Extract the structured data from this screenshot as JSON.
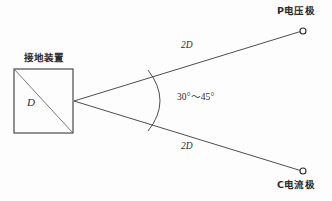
{
  "diagram": {
    "background_color": "#fdfdfd",
    "line_color": "#3a3a3a",
    "text_color": "#2b2b2b",
    "labels": {
      "ground_device": "接地装置",
      "device_diagonal": "D",
      "distance_upper": "2D",
      "distance_lower": "2D",
      "angle_range": "30°～45°",
      "voltage_pole": "P电压极",
      "current_pole": "C电流极"
    },
    "geometry": {
      "device_box": {
        "x": 14,
        "y": 69,
        "width": 59,
        "height": 64
      },
      "vertex": {
        "x": 74,
        "y": 101
      },
      "voltage_pole_point": {
        "x": 303,
        "y": 31
      },
      "current_pole_point": {
        "x": 303,
        "y": 171
      },
      "marker_radius": 3,
      "arc": {
        "start_x": 148,
        "start_y": 70,
        "end_x": 148,
        "end_y": 131,
        "bulge_x": 172,
        "bulge_y": 101
      }
    }
  }
}
